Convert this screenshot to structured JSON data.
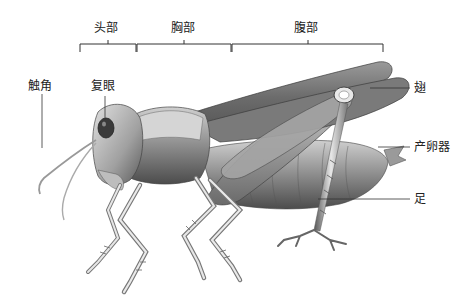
{
  "diagram": {
    "segments": [
      {
        "label": "头部",
        "meaning": "head"
      },
      {
        "label": "胸部",
        "meaning": "thorax"
      },
      {
        "label": "腹部",
        "meaning": "abdomen"
      }
    ],
    "parts": [
      {
        "label": "触角",
        "meaning": "antenna"
      },
      {
        "label": "复眼",
        "meaning": "compound eye"
      },
      {
        "label": "翅",
        "meaning": "wing"
      },
      {
        "label": "产卵器",
        "meaning": "ovipositor"
      },
      {
        "label": "足",
        "meaning": "leg"
      }
    ],
    "colors": {
      "line": "#333333",
      "body_dark": "#4a4a4a",
      "body_mid": "#8a8a8a",
      "body_light": "#d0d0d0"
    }
  }
}
